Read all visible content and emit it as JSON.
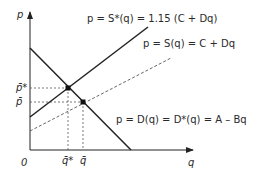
{
  "diagram": {
    "type": "supply-demand",
    "axes": {
      "y_label": "p",
      "x_label": "q",
      "origin_label": "0"
    },
    "curves": {
      "supply_shifted": {
        "label": "p = S*(q) = 1.15 (C + Dq)",
        "style": "solid"
      },
      "supply": {
        "label": "p = S(q) = C + Dq",
        "style": "dashed"
      },
      "demand": {
        "label": "p = D(q) = D*(q) = A – Bq",
        "style": "solid"
      }
    },
    "y_ticks": [
      {
        "label": "p̄*"
      },
      {
        "label": "p̄"
      }
    ],
    "x_ticks": [
      {
        "label": "q̄*"
      },
      {
        "label": "q̄"
      }
    ],
    "equilibria": [
      {
        "name": "shifted",
        "price_label": "p̄*",
        "quantity_label": "q̄*"
      },
      {
        "name": "original",
        "price_label": "p̄",
        "quantity_label": "q̄"
      }
    ],
    "colors": {
      "line": "#222222",
      "dashed": "#555555",
      "text": "#2a2a2a"
    }
  }
}
